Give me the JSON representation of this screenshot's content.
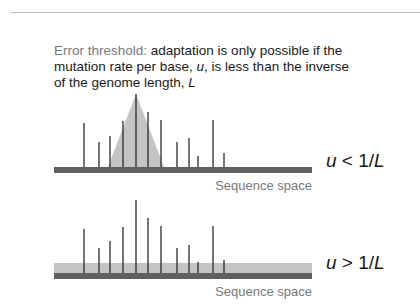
{
  "caption": {
    "lead": "Error threshold",
    "colon": ":",
    "part1": " adaptation is only possible if the mutation rate per base, ",
    "u": "u",
    "part2": ", is less than the inverse of the genome length, ",
    "L": "L"
  },
  "panels": [
    {
      "id": "top",
      "condition_var": "u",
      "condition_rest": " < 1/",
      "condition_L": "L",
      "axis_label": "Sequence space",
      "distribution": "peaked (triangle)"
    },
    {
      "id": "bottom",
      "condition_var": "u",
      "condition_rest": " > 1/",
      "condition_L": "L",
      "axis_label": "Sequence space",
      "distribution": "flat (uniform band)"
    }
  ],
  "fitness_peaks": {
    "x": [
      84,
      99,
      110,
      123,
      136,
      148,
      161,
      177,
      189,
      198,
      213,
      224
    ],
    "relative_heights": [
      0.73,
      0.47,
      0.57,
      0.77,
      1.0,
      0.75,
      0.64,
      0.34,
      0.41,
      0.16,
      0.64,
      0.19
    ]
  },
  "colors": {
    "bar": "#606060",
    "triangle": "#c4c4c4",
    "band": "#c4c4c4",
    "lines": "#2a2a2a",
    "muted_text": "#7a7a7a"
  }
}
